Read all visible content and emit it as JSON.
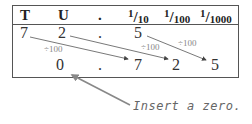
{
  "headers": {
    "tens": "T",
    "units": "U",
    "point": ".",
    "tenths": {
      "num": "1",
      "den": "10"
    },
    "hundredths": {
      "num": "1",
      "den": "100"
    },
    "thousandths": {
      "num": "1",
      "den": "1000"
    }
  },
  "original_row": {
    "tens": "7",
    "units": "2",
    "point": ".",
    "tenths": "5"
  },
  "result_row": {
    "units": "0",
    "point": ".",
    "tenths": "7",
    "hundredths": "2",
    "thousandths": "5"
  },
  "operation_labels": [
    "÷100",
    "÷100",
    "÷100"
  ],
  "annotation": "Insert a zero.",
  "colors": {
    "arrow": "#555555",
    "annotation_arrow": "#888888",
    "label": "#888888"
  }
}
